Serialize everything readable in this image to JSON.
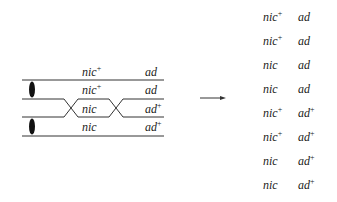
{
  "diagram": {
    "chromatids": [
      {
        "nic": "nic",
        "nic_sup": "+",
        "ad": "ad",
        "ad_sup": ""
      },
      {
        "nic": "nic",
        "nic_sup": "+",
        "ad": "ad",
        "ad_sup": ""
      },
      {
        "nic": "nic",
        "nic_sup": "",
        "ad": "ad",
        "ad_sup": "+"
      },
      {
        "nic": "nic",
        "nic_sup": "",
        "ad": "ad",
        "ad_sup": "+"
      }
    ],
    "arrow": "arrow-right",
    "products": [
      {
        "nic": "nic",
        "nic_sup": "+",
        "ad": "ad",
        "ad_sup": ""
      },
      {
        "nic": "nic",
        "nic_sup": "+",
        "ad": "ad",
        "ad_sup": ""
      },
      {
        "nic": "nic",
        "nic_sup": "",
        "ad": "ad",
        "ad_sup": ""
      },
      {
        "nic": "nic",
        "nic_sup": "",
        "ad": "ad",
        "ad_sup": ""
      },
      {
        "nic": "nic",
        "nic_sup": "+",
        "ad": "ad",
        "ad_sup": "+"
      },
      {
        "nic": "nic",
        "nic_sup": "+",
        "ad": "ad",
        "ad_sup": "+"
      },
      {
        "nic": "nic",
        "nic_sup": "",
        "ad": "ad",
        "ad_sup": "+"
      },
      {
        "nic": "nic",
        "nic_sup": "",
        "ad": "ad",
        "ad_sup": "+"
      }
    ]
  }
}
